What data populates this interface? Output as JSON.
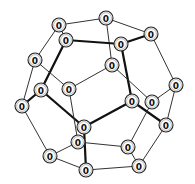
{
  "diagram": {
    "title": "",
    "node_radius": 7,
    "nodes": [
      {
        "id": "A",
        "x": 59,
        "y": 25,
        "label": "0"
      },
      {
        "id": "B",
        "x": 106,
        "y": 18,
        "label": "0"
      },
      {
        "id": "C",
        "x": 151,
        "y": 34,
        "label": "0"
      },
      {
        "id": "D",
        "x": 66,
        "y": 40,
        "label": "0"
      },
      {
        "id": "E",
        "x": 121,
        "y": 44,
        "label": "0"
      },
      {
        "id": "F",
        "x": 35,
        "y": 60,
        "label": "0"
      },
      {
        "id": "G",
        "x": 112,
        "y": 65,
        "label": "0"
      },
      {
        "id": "H",
        "x": 176,
        "y": 85,
        "label": "0"
      },
      {
        "id": "I",
        "x": 41,
        "y": 90,
        "label": "0"
      },
      {
        "id": "J",
        "x": 69,
        "y": 89,
        "label": "0"
      },
      {
        "id": "K",
        "x": 22,
        "y": 106,
        "label": "0"
      },
      {
        "id": "L",
        "x": 132,
        "y": 101,
        "label": "0"
      },
      {
        "id": "M",
        "x": 152,
        "y": 102,
        "label": "0"
      },
      {
        "id": "N",
        "x": 84,
        "y": 127,
        "label": "0"
      },
      {
        "id": "O",
        "x": 166,
        "y": 125,
        "label": "0"
      },
      {
        "id": "P",
        "x": 78,
        "y": 142,
        "label": "0"
      },
      {
        "id": "Q",
        "x": 128,
        "y": 147,
        "label": "0"
      },
      {
        "id": "R",
        "x": 50,
        "y": 156,
        "label": "0"
      },
      {
        "id": "S",
        "x": 86,
        "y": 170,
        "label": "0"
      },
      {
        "id": "T",
        "x": 139,
        "y": 166,
        "label": "0"
      }
    ],
    "edges": [
      {
        "from": "A",
        "to": "B",
        "bold": false
      },
      {
        "from": "B",
        "to": "C",
        "bold": false
      },
      {
        "from": "A",
        "to": "F",
        "bold": false
      },
      {
        "from": "A",
        "to": "D",
        "bold": false
      },
      {
        "from": "B",
        "to": "G",
        "bold": false
      },
      {
        "from": "C",
        "to": "E",
        "bold": true
      },
      {
        "from": "C",
        "to": "H",
        "bold": false
      },
      {
        "from": "D",
        "to": "E",
        "bold": true
      },
      {
        "from": "D",
        "to": "I",
        "bold": true
      },
      {
        "from": "E",
        "to": "L",
        "bold": true
      },
      {
        "from": "F",
        "to": "K",
        "bold": false
      },
      {
        "from": "F",
        "to": "J",
        "bold": false
      },
      {
        "from": "G",
        "to": "J",
        "bold": false
      },
      {
        "from": "G",
        "to": "M",
        "bold": false
      },
      {
        "from": "I",
        "to": "K",
        "bold": true
      },
      {
        "from": "I",
        "to": "N",
        "bold": true
      },
      {
        "from": "J",
        "to": "P",
        "bold": false
      },
      {
        "from": "L",
        "to": "N",
        "bold": true
      },
      {
        "from": "L",
        "to": "O",
        "bold": true
      },
      {
        "from": "H",
        "to": "M",
        "bold": false
      },
      {
        "from": "H",
        "to": "O",
        "bold": false
      },
      {
        "from": "K",
        "to": "R",
        "bold": false
      },
      {
        "from": "N",
        "to": "S",
        "bold": true
      },
      {
        "from": "M",
        "to": "Q",
        "bold": false
      },
      {
        "from": "O",
        "to": "T",
        "bold": false
      },
      {
        "from": "P",
        "to": "Q",
        "bold": false
      },
      {
        "from": "P",
        "to": "R",
        "bold": false
      },
      {
        "from": "R",
        "to": "S",
        "bold": false
      },
      {
        "from": "S",
        "to": "T",
        "bold": false
      },
      {
        "from": "Q",
        "to": "T",
        "bold": false
      }
    ]
  }
}
